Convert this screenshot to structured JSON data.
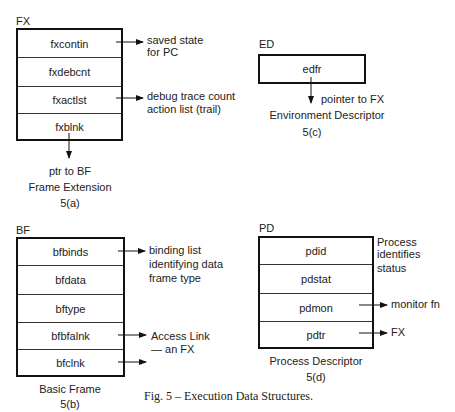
{
  "figure": {
    "caption": "Fig. 5 – Execution Data Structures."
  },
  "fx": {
    "name": "FX",
    "fields": [
      "fxcontin",
      "fxdebcnt",
      "fxactlst",
      "fxblnk"
    ],
    "notes": {
      "fxcontin": [
        "saved state",
        "for PC"
      ],
      "fxactlst": [
        "debug trace count",
        "action list (trail)"
      ],
      "fxblnk": "ptr to BF"
    },
    "title": "Frame Extension",
    "label": "5(a)"
  },
  "ed": {
    "name": "ED",
    "fields": [
      "edfr"
    ],
    "notes": {
      "edfr": "pointer to FX"
    },
    "title": "Environment Descriptor",
    "label": "5(c)"
  },
  "bf": {
    "name": "BF",
    "fields": [
      "bfbinds",
      "bfdata",
      "bftype",
      "bfbfalnk",
      "bfclnk"
    ],
    "notes": {
      "bfbinds": [
        "binding list",
        "identifying data",
        "frame type"
      ],
      "bfbfalnk": [
        "Access Link",
        "— an FX"
      ]
    },
    "title": "Basic Frame",
    "label": "5(b)"
  },
  "pd": {
    "name": "PD",
    "fields": [
      "pdid",
      "pdstat",
      "pdmon",
      "pdtr"
    ],
    "notes": {
      "side": [
        "Process",
        "identifies",
        "status"
      ],
      "pdmon": "monitor fn",
      "pdtr": "FX"
    },
    "title": "Process Descriptor",
    "label": "5(d)"
  }
}
